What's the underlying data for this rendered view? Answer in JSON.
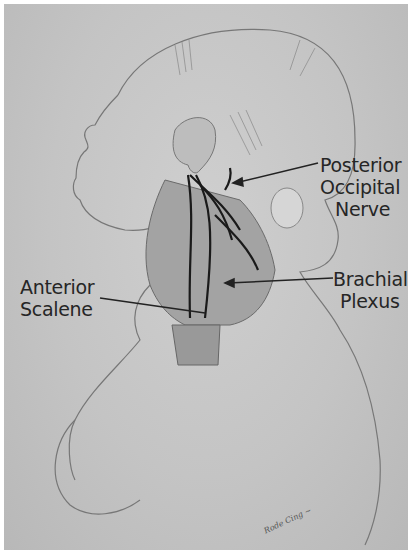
{
  "figure": {
    "labels": {
      "posterior_occipital_nerve": {
        "line1": "Posterior",
        "line2": "Occipital",
        "line3": "Nerve"
      },
      "brachial_plexus": {
        "line1": "Brachial",
        "line2": "Plexus"
      },
      "anterior_scalene": {
        "line1": "Anterior",
        "line2": "Scalene"
      }
    },
    "signature": "Rode Cing ~",
    "colors": {
      "background": "#c6c6c6",
      "ink": "#262626",
      "skin_shade": "#a9a9a9",
      "nerve": "#1a1a1a"
    }
  }
}
